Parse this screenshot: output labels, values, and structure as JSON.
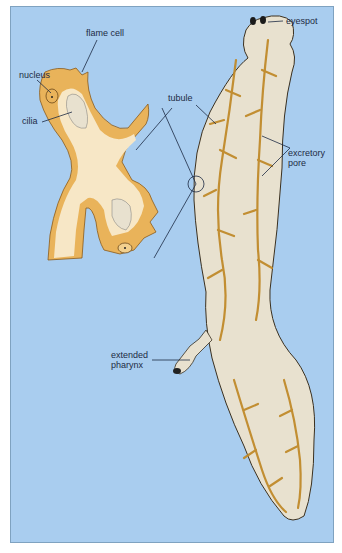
{
  "figure": {
    "colors": {
      "background": "#a9cdef",
      "cell": "#e9b35a",
      "lumen": "#f7e7c6",
      "body": "#e8e1cf",
      "line": "#1d2b44"
    },
    "labels": {
      "flame_cell": "flame cell",
      "nucleus": "nucleus",
      "cilia": "cilia",
      "tubule": "tubule",
      "eyespot": "eyespot",
      "excretory_pore_1": "excretory",
      "excretory_pore_2": "pore",
      "pharynx_1": "extended",
      "pharynx_2": "pharynx"
    }
  }
}
